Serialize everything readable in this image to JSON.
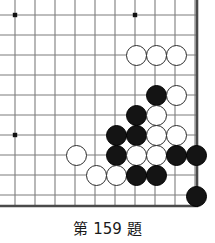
{
  "figure": {
    "kind": "go-problem-diagram",
    "caption": "第 159 題",
    "problem_number": "159"
  },
  "board": {
    "colors": {
      "background": "#ffffff",
      "grid_line": "#7d7d7d",
      "border_line": "#4a4a4a",
      "black_stone": "#141414",
      "white_stone": "#ffffff",
      "white_stone_outline": "#2b2b2b"
    },
    "geometry": {
      "origin_x": 15,
      "origin_y": 15,
      "spacing": 20,
      "cols": 10,
      "rows": 10,
      "stone_diameter": 21,
      "right_edge_x": 197,
      "bottom_edge_y": 206
    },
    "star_points": [
      {
        "x": 15,
        "y": 15
      },
      {
        "x": 135,
        "y": 15
      },
      {
        "x": 15,
        "y": 135
      }
    ],
    "stones": [
      {
        "color": "white",
        "x": 136,
        "y": 55
      },
      {
        "color": "white",
        "x": 156,
        "y": 55
      },
      {
        "color": "white",
        "x": 176,
        "y": 55
      },
      {
        "color": "black",
        "x": 156,
        "y": 95
      },
      {
        "color": "white",
        "x": 176,
        "y": 95
      },
      {
        "color": "black",
        "x": 136,
        "y": 115
      },
      {
        "color": "white",
        "x": 156,
        "y": 115
      },
      {
        "color": "black",
        "x": 116,
        "y": 135
      },
      {
        "color": "black",
        "x": 136,
        "y": 135
      },
      {
        "color": "white",
        "x": 156,
        "y": 135
      },
      {
        "color": "white",
        "x": 176,
        "y": 135
      },
      {
        "color": "white",
        "x": 76,
        "y": 155
      },
      {
        "color": "black",
        "x": 116,
        "y": 155
      },
      {
        "color": "white",
        "x": 136,
        "y": 155
      },
      {
        "color": "white",
        "x": 156,
        "y": 155
      },
      {
        "color": "black",
        "x": 176,
        "y": 155
      },
      {
        "color": "black",
        "x": 196,
        "y": 155
      },
      {
        "color": "white",
        "x": 96,
        "y": 175
      },
      {
        "color": "white",
        "x": 116,
        "y": 175
      },
      {
        "color": "black",
        "x": 136,
        "y": 175
      },
      {
        "color": "black",
        "x": 156,
        "y": 175
      },
      {
        "color": "black",
        "x": 196,
        "y": 196
      }
    ]
  }
}
